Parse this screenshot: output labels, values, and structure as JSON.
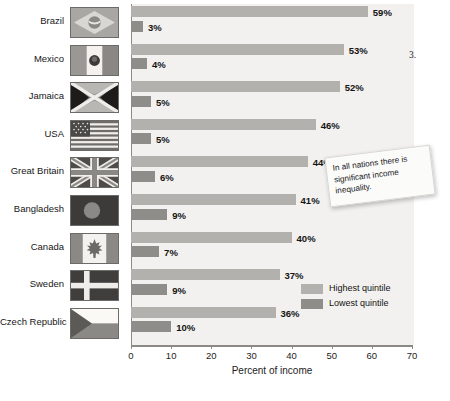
{
  "chart_data": {
    "type": "bar",
    "orientation": "horizontal",
    "title": "",
    "xlabel": "Percent of income",
    "ylabel": "",
    "xlim": [
      0,
      70
    ],
    "xticks": [
      0,
      10,
      20,
      30,
      40,
      50,
      60,
      70
    ],
    "grid": false,
    "legend_position": "inside-bottom-right",
    "categories": [
      "Brazil",
      "Mexico",
      "Jamaica",
      "USA",
      "Great Britain",
      "Bangladesh",
      "Canada",
      "Sweden",
      "Czech Republic"
    ],
    "series": [
      {
        "name": "Highest quintile",
        "color": "#b3b1ad",
        "values": [
          59,
          53,
          52,
          46,
          44,
          41,
          40,
          37,
          36
        ],
        "labels": [
          "59%",
          "53%",
          "52%",
          "46%",
          "44%",
          "41%",
          "40%",
          "37%",
          "36%"
        ]
      },
      {
        "name": "Lowest quintile",
        "color": "#8f8d89",
        "values": [
          3,
          4,
          5,
          5,
          6,
          9,
          7,
          9,
          10
        ],
        "labels": [
          "3%",
          "4%",
          "5%",
          "5%",
          "6%",
          "9%",
          "7%",
          "9%",
          "10%"
        ]
      }
    ],
    "annotations": [
      {
        "text": "In all nations there is significant income inequality."
      }
    ]
  },
  "flags": [
    {
      "country": "Brazil",
      "icon": "flag-brazil"
    },
    {
      "country": "Mexico",
      "icon": "flag-mexico"
    },
    {
      "country": "Jamaica",
      "icon": "flag-jamaica"
    },
    {
      "country": "USA",
      "icon": "flag-usa"
    },
    {
      "country": "Great Britain",
      "icon": "flag-great-britain"
    },
    {
      "country": "Bangladesh",
      "icon": "flag-bangladesh"
    },
    {
      "country": "Canada",
      "icon": "flag-canada"
    },
    {
      "country": "Sweden",
      "icon": "flag-sweden"
    },
    {
      "country": "Czech Republic",
      "icon": "flag-czech-republic"
    }
  ],
  "legend": {
    "items": [
      {
        "label": "Highest quintile",
        "color": "#b3b1ad"
      },
      {
        "label": "Lowest quintile",
        "color": "#8f8d89"
      }
    ]
  },
  "callout": {
    "text": "In all nations there is significant income inequality."
  },
  "page_text": {
    "list_number": "3.",
    "fragment_top": "",
    "fragment_item3": "",
    "fragment_bottom": ""
  }
}
